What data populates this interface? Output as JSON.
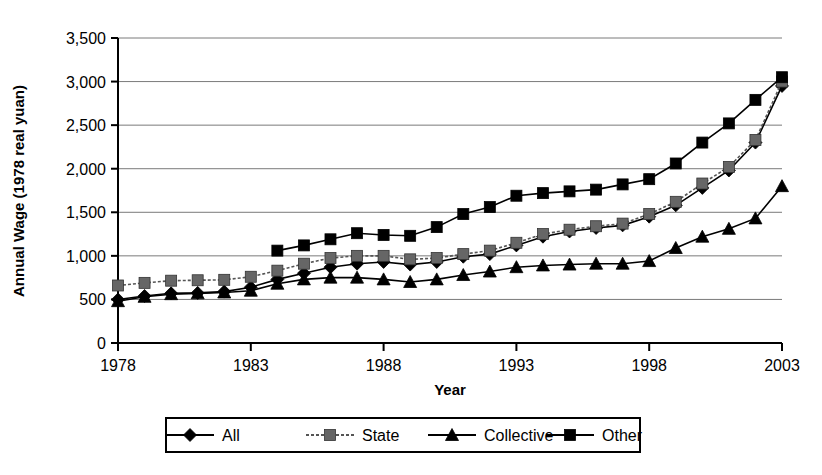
{
  "chart_data": {
    "type": "line",
    "title": "",
    "xlabel": "Year",
    "ylabel": "Annual Wage (1978 real yuan)",
    "xlim": [
      1978,
      2003
    ],
    "ylim": [
      0,
      3500
    ],
    "xticks": [
      "1978",
      "1983",
      "1988",
      "1993",
      "1998",
      "2003"
    ],
    "xtick_values": [
      1978,
      1983,
      1988,
      1993,
      1998,
      2003
    ],
    "yticks": [
      "0",
      "500",
      "1,000",
      "1,500",
      "2,000",
      "2,500",
      "3,000",
      "3,500"
    ],
    "ytick_values": [
      0,
      500,
      1000,
      1500,
      2000,
      2500,
      3000,
      3500
    ],
    "grid": "horizontal",
    "legend_position": "bottom",
    "x": [
      1978,
      1979,
      1980,
      1981,
      1982,
      1983,
      1984,
      1985,
      1986,
      1987,
      1988,
      1989,
      1990,
      1991,
      1992,
      1993,
      1994,
      1995,
      1996,
      1997,
      1998,
      1999,
      2000,
      2001,
      2002,
      2003
    ],
    "series": [
      {
        "name": "All",
        "marker": "diamond",
        "color": "#000000",
        "line": "solid",
        "values": [
          500,
          540,
          570,
          575,
          590,
          640,
          730,
          800,
          870,
          910,
          930,
          900,
          930,
          990,
          1020,
          1120,
          1220,
          1280,
          1320,
          1350,
          1450,
          1580,
          1780,
          1980,
          2300,
          2950
        ]
      },
      {
        "name": "State",
        "marker": "square",
        "color": "#666666",
        "line": "dashed",
        "values": [
          660,
          690,
          715,
          720,
          725,
          760,
          830,
          910,
          975,
          1000,
          1000,
          960,
          975,
          1020,
          1060,
          1150,
          1250,
          1300,
          1340,
          1370,
          1480,
          1620,
          1830,
          2020,
          2330,
          3000
        ]
      },
      {
        "name": "Collective",
        "marker": "triangle",
        "color": "#000000",
        "line": "solid",
        "values": [
          480,
          530,
          560,
          570,
          580,
          600,
          680,
          730,
          750,
          750,
          730,
          700,
          730,
          780,
          820,
          870,
          890,
          900,
          910,
          910,
          940,
          1090,
          1220,
          1310,
          1430,
          1800
        ]
      },
      {
        "name": "Other",
        "marker": "square",
        "color": "#000000",
        "line": "solid",
        "values": [
          null,
          null,
          null,
          null,
          null,
          null,
          1060,
          1120,
          1190,
          1260,
          1240,
          1230,
          1330,
          1480,
          1560,
          1690,
          1720,
          1740,
          1760,
          1820,
          1880,
          2060,
          2300,
          2520,
          2790,
          3050
        ]
      }
    ]
  },
  "legend": {
    "entries": [
      {
        "label": "All"
      },
      {
        "label": "State"
      },
      {
        "label": "Collective"
      },
      {
        "label": "Other"
      }
    ]
  }
}
